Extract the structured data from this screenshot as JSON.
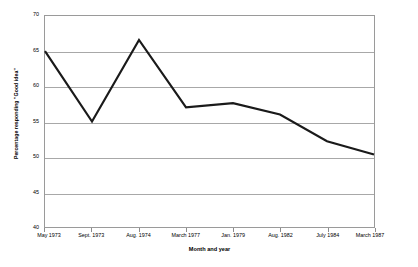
{
  "chart_data": {
    "type": "line",
    "title": "",
    "subtitle": "",
    "xlabel": "Month and year",
    "ylabel": "Percentage responding \"Good idea\"",
    "categories": [
      "May 1973",
      "Sept. 1973",
      "Aug. 1974",
      "March 1977",
      "Jan. 1979",
      "Aug. 1982",
      "July 1984",
      "March 1987"
    ],
    "values": [
      65.0,
      55.0,
      66.6,
      57.0,
      57.6,
      56.0,
      52.2,
      50.3
    ],
    "series": [
      {
        "name": "Percentage responding \"Good idea\"",
        "values": [
          65.0,
          55.0,
          66.6,
          57.0,
          57.6,
          56.0,
          52.2,
          50.3
        ]
      }
    ],
    "ylim": [
      40,
      70
    ],
    "yticks": [
      40,
      45,
      50,
      55,
      60,
      65,
      70
    ],
    "ytick_labels": [
      "40",
      "45",
      "50",
      "55",
      "60",
      "65",
      "70"
    ],
    "xlim_categories": 8,
    "grid": "horizontal",
    "legend": "none",
    "line_color": "#1a1a1a",
    "grid_color": "#a8a8a8",
    "axis_color": "#9a9a9a",
    "background_color": "#ffffff"
  }
}
